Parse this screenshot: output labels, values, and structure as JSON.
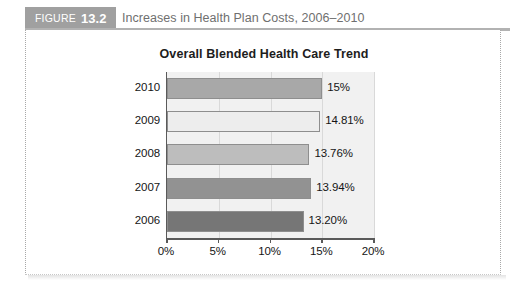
{
  "figure": {
    "badge_word": "FIGURE",
    "badge_number": "13.2",
    "caption": "Increases in Health Plan Costs, 2006–2010"
  },
  "chart_data": {
    "type": "bar",
    "orientation": "horizontal",
    "title": "Overall Blended Health Care Trend",
    "xlabel": "",
    "ylabel": "",
    "categories": [
      "2010",
      "2009",
      "2008",
      "2007",
      "2006"
    ],
    "values": [
      15.0,
      14.81,
      13.76,
      13.94,
      13.2
    ],
    "value_labels": [
      "15%",
      "14.81%",
      "13.76%",
      "13.94%",
      "13.20%"
    ],
    "bar_colors": [
      "#a8a8a8",
      "#ededed",
      "#bdbdbd",
      "#929292",
      "#767676"
    ],
    "bar_border_color": "#8e8e8e",
    "xlim": [
      0,
      20
    ],
    "xticks": [
      0,
      5,
      10,
      15,
      20
    ],
    "xtick_labels": [
      "0%",
      "5%",
      "10%",
      "15%",
      "20%"
    ],
    "grid": true,
    "grid_color": "#d9d9d9",
    "plot_background": "#f1f1f1",
    "axis_color": "#5a5a5a",
    "legend": null
  }
}
